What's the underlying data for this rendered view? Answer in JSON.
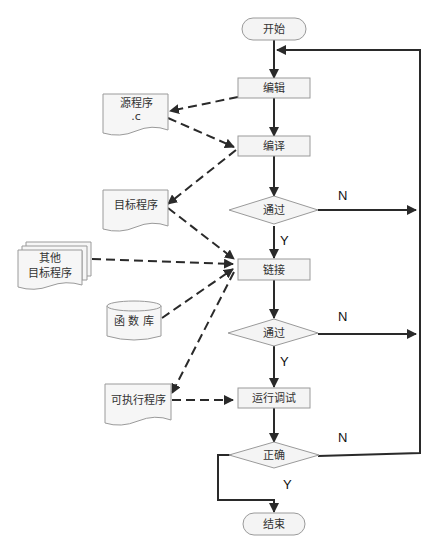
{
  "diagram": {
    "type": "flowchart",
    "nodes": {
      "start": "开始",
      "edit": "编辑",
      "compile": "编译",
      "pass1": "通过",
      "link": "链接",
      "pass2": "通过",
      "run": "运行调试",
      "correct": "正确",
      "end": "结束",
      "source_line1": "源程序",
      "source_line2": ".c",
      "object": "目标程序",
      "other_line1": "其他",
      "other_line2": "目标程序",
      "library": "函 数 库",
      "executable": "可执行程序"
    },
    "labels": {
      "yes": "Y",
      "no": "N"
    },
    "colors": {
      "line": "#2a2a2a",
      "node_fill": "#f4f4f4",
      "node_stroke": "#9a9a9a"
    }
  }
}
